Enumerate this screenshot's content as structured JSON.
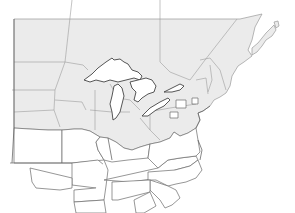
{
  "map": {
    "title": "",
    "region": "Northeastern United States, Great Lakes and southeastern Canada",
    "colors": {
      "highlighted_region": "#ebebeb",
      "other_states": "#ffffff",
      "background": "#ffffff",
      "border": "#9a9a9a"
    },
    "highlighted_area": "Northern tier (Dakotas, Minnesota, Wisconsin, Michigan, Ohio Valley north, New England, southern Canada)",
    "non_highlighted_area": "Central and southern states (Kansas, Oklahoma, Missouri, Kentucky, Tennessee, Virginia, North Carolina, etc.)"
  }
}
